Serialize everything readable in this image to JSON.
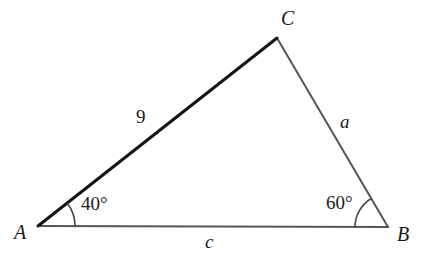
{
  "figure": {
    "type": "triangle-diagram",
    "background_color": "#ffffff",
    "vertices": {
      "A": {
        "label": "A",
        "x": 38,
        "y": 226
      },
      "B": {
        "label": "B",
        "x": 388,
        "y": 227
      },
      "C": {
        "label": "C",
        "x": 277,
        "y": 38
      }
    },
    "sides": [
      {
        "name": "side-AC",
        "label": "9",
        "from": "A",
        "to": "C",
        "color": "#141414",
        "width": 3,
        "emphasis": "bold"
      },
      {
        "name": "side-CB",
        "label": "a",
        "from": "C",
        "to": "B",
        "color": "#555555",
        "width": 2,
        "emphasis": "normal"
      },
      {
        "name": "side-AB",
        "label": "c",
        "from": "A",
        "to": "B",
        "color": "#555555",
        "width": 2,
        "emphasis": "normal"
      }
    ],
    "angles": [
      {
        "name": "angle-A",
        "label": "40°",
        "vertex": "A",
        "value": 40,
        "unit": "degrees",
        "arc_radius": 37,
        "arc_color": "#444444"
      },
      {
        "name": "angle-B",
        "label": "60°",
        "vertex": "B",
        "value": 60,
        "unit": "degrees",
        "arc_radius": 33,
        "arc_color": "#444444"
      }
    ]
  },
  "chart_data": {
    "type": "diagram",
    "title": "",
    "shape": "triangle",
    "vertex_labels": [
      "A",
      "B",
      "C"
    ],
    "side_labels": [
      "9",
      "a",
      "c"
    ],
    "angle_labels": [
      "40°",
      "60°"
    ],
    "known_values": {
      "side_AC": 9,
      "angle_A": 40,
      "angle_B": 60
    },
    "unknown_values": [
      "a",
      "c"
    ]
  }
}
